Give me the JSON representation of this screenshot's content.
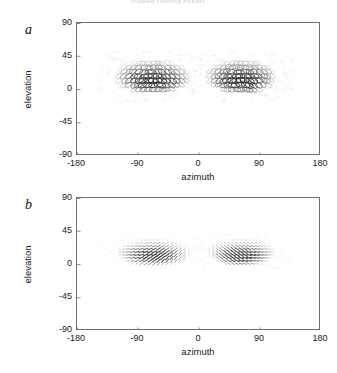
{
  "header": {
    "running_text": "clipped running header"
  },
  "figure": {
    "panels": [
      {
        "letter": "a",
        "x_axis": {
          "title": "azimuth",
          "ticks": [
            "-180",
            "-90",
            "0",
            "90",
            "180"
          ],
          "tick_values": [
            -180,
            -90,
            0,
            90,
            180
          ],
          "range": [
            -180,
            180
          ]
        },
        "y_axis": {
          "title": "elevation",
          "ticks": [
            "90",
            "45",
            "0",
            "-45",
            "-90"
          ],
          "tick_values": [
            90,
            45,
            0,
            -45,
            -90
          ],
          "range": [
            -90,
            90
          ]
        }
      },
      {
        "letter": "b",
        "x_axis": {
          "title": "azimuth",
          "ticks": [
            "-180",
            "-90",
            "0",
            "90",
            "180"
          ],
          "tick_values": [
            -180,
            -90,
            0,
            90,
            180
          ],
          "range": [
            -180,
            180
          ]
        },
        "y_axis": {
          "title": "elevation",
          "ticks": [
            "90",
            "45",
            "0",
            "-45",
            "-90"
          ],
          "tick_values": [
            90,
            45,
            0,
            -45,
            -90
          ],
          "range": [
            -90,
            90
          ]
        }
      }
    ]
  },
  "chart_data": [
    {
      "type": "scatter",
      "title": "",
      "subtitle": "",
      "panel": "a",
      "glyph": "ellipse-loop",
      "xlabel": "azimuth",
      "ylabel": "elevation",
      "xlim": [
        -180,
        180
      ],
      "ylim": [
        -90,
        90
      ],
      "xticks": [
        -180,
        -90,
        0,
        90,
        180
      ],
      "yticks": [
        -90,
        -45,
        0,
        45,
        90
      ],
      "grid": false,
      "legend": "none",
      "description": "Two mirror-symmetric dome-shaped clusters of overlapping ellipse glyphs in the upper visual field, one in each hemifield.",
      "clusters": [
        {
          "name": "left-hemifield",
          "x_range": [
            -125,
            -12
          ],
          "y_range": [
            -2,
            46
          ],
          "centroid": [
            -68,
            18
          ],
          "n_glyphs": 120,
          "peak_density_at": [
            -72,
            12
          ]
        },
        {
          "name": "right-hemifield",
          "x_range": [
            12,
            118
          ],
          "y_range": [
            -2,
            46
          ],
          "centroid": [
            62,
            18
          ],
          "n_glyphs": 120,
          "peak_density_at": [
            60,
            12
          ]
        }
      ]
    },
    {
      "type": "scatter",
      "title": "",
      "subtitle": "",
      "panel": "b",
      "glyph": "oriented-dash",
      "xlabel": "azimuth",
      "ylabel": "elevation",
      "xlim": [
        -180,
        180
      ],
      "ylim": [
        -90,
        90
      ],
      "xticks": [
        -180,
        -90,
        0,
        90,
        180
      ],
      "yticks": [
        -90,
        -45,
        0,
        45,
        90
      ],
      "grid": false,
      "legend": "none",
      "description": "Two mirror-symmetric clusters of short oriented dashes forming a sparse vector field, lower amplitude and flatter than panel a.",
      "clusters": [
        {
          "name": "left-hemifield",
          "x_range": [
            -125,
            -10
          ],
          "y_range": [
            0,
            40
          ],
          "centroid": [
            -66,
            17
          ],
          "n_glyphs": 150,
          "peak_density_at": [
            -70,
            14
          ]
        },
        {
          "name": "right-hemifield",
          "x_range": [
            10,
            115
          ],
          "y_range": [
            0,
            40
          ],
          "centroid": [
            62,
            17
          ],
          "n_glyphs": 150,
          "peak_density_at": [
            62,
            14
          ]
        }
      ]
    }
  ]
}
